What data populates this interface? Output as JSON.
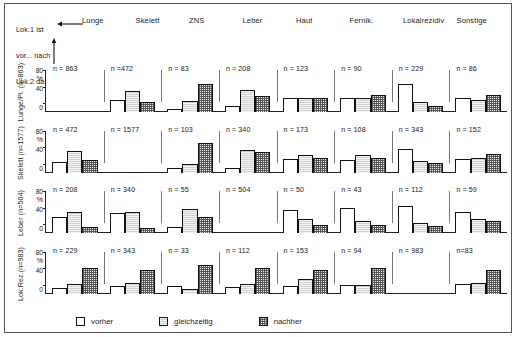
{
  "figure": {
    "caption_lines": [
      "Lok.1 ist",
      "vor... nach",
      "Lok.2 da"
    ],
    "arrow_right_name": "arrow-right-icon",
    "arrow_up_name": "arrow-up-icon"
  },
  "legend": {
    "items": [
      {
        "label": "vorher",
        "fill": "vorher",
        "color": "#ffffff"
      },
      {
        "label": "gleichzeitig",
        "fill": "gleichzeitig",
        "color": "#d2d2d2"
      },
      {
        "label": "nachher",
        "fill": "nachher",
        "color": "#b4b4b4"
      }
    ]
  },
  "axis": {
    "ticks": [
      "80",
      "40",
      "0"
    ],
    "unit": "%",
    "ymin": 0,
    "ymax": 80
  },
  "chart_data": {
    "type": "bar",
    "title": "Lok.1 ist vor... nach Lok.2 da",
    "xlabel": "",
    "ylabel": "%",
    "ylim": [
      0,
      80
    ],
    "grid": false,
    "legend_position": "bottom",
    "series_names": [
      "vorher",
      "gleichzeitig",
      "nachher"
    ],
    "categories": [
      "Lunge",
      "Skelett",
      "ZNS",
      "Leber",
      "Haut",
      "Fernlk.",
      "Lokalrezidiv",
      "Sonstige"
    ],
    "row_labels": [
      "Lunge/Pl. (n=863)",
      "Skelett (n=1577)",
      "Leber (n=504)",
      "Lok.Rez.(n=983)"
    ],
    "panels": [
      {
        "row": "Lunge/Pl. (n=863)",
        "cells": [
          {
            "category": "Lunge",
            "n_label": "n = 863",
            "n": 863,
            "values": [
              null,
              null,
              null
            ],
            "empty": true
          },
          {
            "category": "Skelett",
            "n_label": "n =472",
            "n": 472,
            "values": [
              29,
              50,
              25
            ]
          },
          {
            "category": "ZNS",
            "n_label": "n = 83",
            "n": 83,
            "values": [
              7,
              27,
              67
            ]
          },
          {
            "category": "Leber",
            "n_label": "n = 208",
            "n": 208,
            "values": [
              15,
              54,
              40
            ]
          },
          {
            "category": "Haut",
            "n_label": "n = 123",
            "n": 123,
            "values": [
              34,
              35,
              34
            ]
          },
          {
            "category": "Fernlk.",
            "n_label": "n = 90",
            "n": 90,
            "values": [
              33,
              34,
              41
            ]
          },
          {
            "category": "Lokalrezidiv",
            "n_label": "n = 229",
            "n": 229,
            "values": [
              69,
              24,
              14
            ]
          },
          {
            "category": "Sonstige",
            "n_label": "n = 86",
            "n": 86,
            "values": [
              35,
              30,
              42
            ]
          }
        ]
      },
      {
        "row": "Skelett (n=1577)",
        "cells": [
          {
            "category": "Lunge",
            "n_label": "n = 472",
            "n": 472,
            "values": [
              25,
              51,
              30
            ]
          },
          {
            "category": "Skelett",
            "n_label": "n = 1577",
            "n": 1577,
            "values": [
              null,
              null,
              null
            ],
            "empty": true
          },
          {
            "category": "ZNS",
            "n_label": "n = 103",
            "n": 103,
            "values": [
              12,
              21,
              72
            ]
          },
          {
            "category": "Leber",
            "n_label": "n = 340",
            "n": 340,
            "values": [
              10,
              54,
              50
            ]
          },
          {
            "category": "Haut",
            "n_label": "n = 173",
            "n": 173,
            "values": [
              33,
              42,
              36
            ]
          },
          {
            "category": "Fernlk.",
            "n_label": "n = 108",
            "n": 108,
            "values": [
              31,
              42,
              36
            ]
          },
          {
            "category": "Lokalrezidiv",
            "n_label": "n = 343",
            "n": 343,
            "values": [
              58,
              27,
              22
            ]
          },
          {
            "category": "Sonstige",
            "n_label": "n = 152",
            "n": 152,
            "values": [
              32,
              35,
              45
            ]
          }
        ]
      },
      {
        "row": "Leber (n=504)",
        "cells": [
          {
            "category": "Lunge",
            "n_label": "n = 208",
            "n": 208,
            "values": [
              39,
              51,
              15
            ]
          },
          {
            "category": "Skelett",
            "n_label": "n = 340",
            "n": 340,
            "values": [
              48,
              52,
              11
            ]
          },
          {
            "category": "ZNS",
            "n_label": "n = 55",
            "n": 55,
            "values": [
              14,
              58,
              39
            ]
          },
          {
            "category": "Leber",
            "n_label": "n = 504",
            "n": 504,
            "values": [
              null,
              null,
              null
            ],
            "empty": true
          },
          {
            "category": "Haut",
            "n_label": "n = 50",
            "n": 50,
            "values": [
              57,
              33,
              20
            ]
          },
          {
            "category": "Fernlk.",
            "n_label": "n = 43",
            "n": 43,
            "values": [
              61,
              28,
              19
            ]
          },
          {
            "category": "Lokalrezidiv",
            "n_label": "n = 112",
            "n": 112,
            "values": [
              66,
              24,
              17
            ]
          },
          {
            "category": "Sonstige",
            "n_label": "n = 59",
            "n": 59,
            "values": [
              51,
              35,
              28
            ]
          }
        ]
      },
      {
        "row": "Lok.Rez.(n=983)",
        "cells": [
          {
            "category": "Lunge",
            "n_label": "n = 229",
            "n": 229,
            "values": [
              13,
              22,
              62
            ]
          },
          {
            "category": "Skelett",
            "n_label": "n = 343",
            "n": 343,
            "values": [
              19,
              25,
              57
            ]
          },
          {
            "category": "ZNS",
            "n_label": "n = 33",
            "n": 33,
            "values": [
              18,
              12,
              68
            ]
          },
          {
            "category": "Leber",
            "n_label": "n = 112",
            "n": 112,
            "values": [
              15,
              22,
              62
            ]
          },
          {
            "category": "Haut",
            "n_label": "n = 153",
            "n": 153,
            "values": [
              19,
              34,
              56
            ]
          },
          {
            "category": "Fernlk.",
            "n_label": "n = 94",
            "n": 94,
            "values": [
              20,
              21,
              61
            ]
          },
          {
            "category": "Lokalrezidiv",
            "n_label": "n = 983",
            "n": 983,
            "values": [
              null,
              null,
              null
            ],
            "empty": true
          },
          {
            "category": "Sonstige",
            "n_label": "n=83",
            "n": 83,
            "values": [
              23,
              25,
              58
            ]
          }
        ]
      }
    ]
  }
}
